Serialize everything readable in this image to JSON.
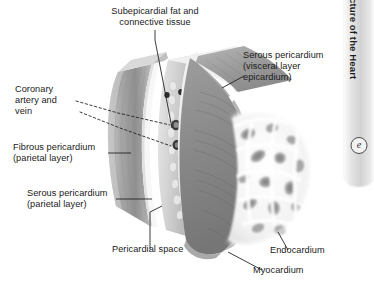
{
  "figure": {
    "title_tab": "Animation: Structure of the Heart",
    "tab_icon": "circled-e-icon",
    "background_color": "#ffffff",
    "text_color": "#1a1a1a"
  },
  "labels": {
    "subepicardial_fat": "Subepicardial fat and\nconnective tissue",
    "serous_visceral": "Serous pericardium\n(visceral layer\nepicardium)",
    "coronary_vessels": "Coronary\nartery and\nvein",
    "fibrous_pericardium": "Fibrous pericardium\n(parietal layer)",
    "serous_parietal": "Serous pericardium\n(parietal layer)",
    "pericardial_space": "Pericardial space",
    "endocardium": "Endocardium",
    "myocardium": "Myocardium"
  },
  "anatomy_colors": {
    "fibrous_pericardium": "#9a9a9a",
    "serous_parietal": "#f4f4f4",
    "pericardial_space": "#ffffff",
    "epicardium": "#e8e8e8",
    "myocardium": "#8e8e8e",
    "myocardium_dark": "#6f6f6f",
    "endocardium": "#fdfdfd",
    "vessel": "#2e2e2e",
    "fat": "#d8d8d8"
  }
}
